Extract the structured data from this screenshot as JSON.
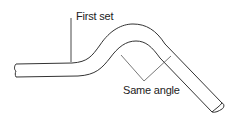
{
  "diagram": {
    "labels": {
      "first_set": "First set",
      "same_angle": "Same angle"
    },
    "colors": {
      "line": "#333333",
      "background": "#ffffff"
    }
  }
}
